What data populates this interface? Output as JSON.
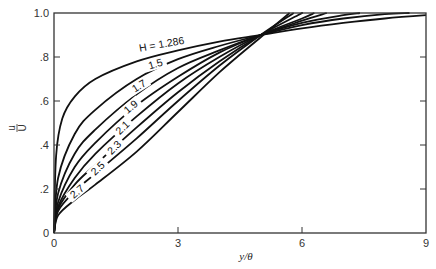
{
  "chart_data": {
    "type": "line",
    "title": "",
    "xlabel": "y/θ",
    "ylabel": "u/U",
    "xlim": [
      0,
      9
    ],
    "ylim": [
      0,
      1.0
    ],
    "grid": false,
    "legend": "none (inline curve labels)",
    "x_ticks": [
      "0",
      "3",
      "6",
      "9"
    ],
    "y_ticks": [
      "0",
      ".2",
      ".4",
      ".6",
      ".8",
      "1.0"
    ],
    "annotation": "Curves labeled by shape factor H; all curves cross near y/θ ≈ 5.0, u/U ≈ 0.9",
    "series": [
      {
        "name": "H = 1.286",
        "label": "H = 1.286",
        "points": [
          [
            0,
            0
          ],
          [
            0.05,
            0.35
          ],
          [
            0.2,
            0.52
          ],
          [
            0.5,
            0.62
          ],
          [
            1,
            0.7
          ],
          [
            2,
            0.78
          ],
          [
            3,
            0.83
          ],
          [
            4,
            0.87
          ],
          [
            5,
            0.9
          ],
          [
            6,
            0.93
          ],
          [
            7,
            0.955
          ],
          [
            8,
            0.975
          ],
          [
            9,
            0.99
          ]
        ]
      },
      {
        "name": "H = 1.5",
        "label": "1.5",
        "points": [
          [
            0,
            0
          ],
          [
            0.1,
            0.25
          ],
          [
            0.5,
            0.45
          ],
          [
            1,
            0.56
          ],
          [
            2,
            0.7
          ],
          [
            3,
            0.79
          ],
          [
            4,
            0.85
          ],
          [
            5,
            0.9
          ],
          [
            6,
            0.945
          ],
          [
            7,
            0.975
          ],
          [
            8,
            0.995
          ],
          [
            8.6,
            1.0
          ]
        ]
      },
      {
        "name": "H = 1.7",
        "label": "1.7",
        "points": [
          [
            0,
            0
          ],
          [
            0.1,
            0.18
          ],
          [
            0.5,
            0.36
          ],
          [
            1,
            0.47
          ],
          [
            2,
            0.63
          ],
          [
            3,
            0.75
          ],
          [
            4,
            0.83
          ],
          [
            5,
            0.9
          ],
          [
            6,
            0.955
          ],
          [
            7,
            0.99
          ],
          [
            7.4,
            1.0
          ]
        ]
      },
      {
        "name": "H = 1.9",
        "label": "1.9",
        "points": [
          [
            0,
            0
          ],
          [
            0.1,
            0.14
          ],
          [
            0.5,
            0.3
          ],
          [
            1,
            0.41
          ],
          [
            2,
            0.58
          ],
          [
            3,
            0.71
          ],
          [
            4,
            0.82
          ],
          [
            5,
            0.9
          ],
          [
            6,
            0.965
          ],
          [
            6.6,
            1.0
          ]
        ]
      },
      {
        "name": "H = 2.1",
        "label": "2.1",
        "points": [
          [
            0,
            0
          ],
          [
            0.1,
            0.12
          ],
          [
            0.5,
            0.25
          ],
          [
            1,
            0.36
          ],
          [
            2,
            0.53
          ],
          [
            3,
            0.68
          ],
          [
            4,
            0.8
          ],
          [
            5,
            0.9
          ],
          [
            6,
            0.975
          ],
          [
            6.3,
            1.0
          ]
        ]
      },
      {
        "name": "H = 2.3",
        "label": "2.3",
        "points": [
          [
            0,
            0
          ],
          [
            0.1,
            0.11
          ],
          [
            0.5,
            0.22
          ],
          [
            1,
            0.31
          ],
          [
            2,
            0.48
          ],
          [
            3,
            0.64
          ],
          [
            4,
            0.78
          ],
          [
            5,
            0.9
          ],
          [
            5.9,
            0.99
          ],
          [
            6.0,
            1.0
          ]
        ]
      },
      {
        "name": "H = 2.5",
        "label": "2.5",
        "points": [
          [
            0,
            0
          ],
          [
            0.1,
            0.1
          ],
          [
            0.5,
            0.19
          ],
          [
            1,
            0.27
          ],
          [
            2,
            0.43
          ],
          [
            3,
            0.6
          ],
          [
            4,
            0.76
          ],
          [
            5,
            0.9
          ],
          [
            5.8,
            1.0
          ]
        ]
      },
      {
        "name": "H = 2.7",
        "label": "2.7",
        "points": [
          [
            0,
            0
          ],
          [
            0.1,
            0.08
          ],
          [
            0.5,
            0.15
          ],
          [
            1,
            0.22
          ],
          [
            2,
            0.37
          ],
          [
            3,
            0.55
          ],
          [
            4,
            0.73
          ],
          [
            5,
            0.89
          ],
          [
            5.7,
            1.0
          ]
        ]
      }
    ]
  },
  "labels": {
    "xlabel": "y/θ",
    "ylabel_num": "u",
    "ylabel_den": "U"
  }
}
